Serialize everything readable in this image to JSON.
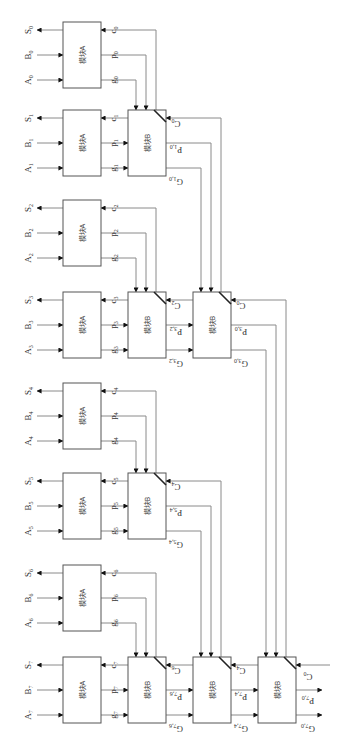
{
  "diagram": {
    "module_a_label": "模块A",
    "module_b_label": "模块B",
    "inputs": [
      {
        "a": "A",
        "b": "B",
        "s": "S",
        "i": "0",
        "c": "c",
        "p": "p",
        "g": "g"
      },
      {
        "a": "A",
        "b": "B",
        "s": "S",
        "i": "1",
        "c": "c",
        "p": "p",
        "g": "g"
      },
      {
        "a": "A",
        "b": "B",
        "s": "S",
        "i": "2",
        "c": "c",
        "p": "p",
        "g": "g"
      },
      {
        "a": "A",
        "b": "B",
        "s": "S",
        "i": "3",
        "c": "c",
        "p": "p",
        "g": "g"
      },
      {
        "a": "A",
        "b": "B",
        "s": "S",
        "i": "4",
        "c": "c",
        "p": "p",
        "g": "g"
      },
      {
        "a": "A",
        "b": "B",
        "s": "S",
        "i": "5",
        "c": "c",
        "p": "p",
        "g": "g"
      },
      {
        "a": "A",
        "b": "B",
        "s": "S",
        "i": "6",
        "c": "c",
        "p": "p",
        "g": "g"
      },
      {
        "a": "A",
        "b": "B",
        "s": "S",
        "i": "7",
        "c": "c",
        "p": "p",
        "g": "g"
      }
    ],
    "b_blocks": [
      {
        "id": "B10",
        "level": 1,
        "cin": "C",
        "cin_sub": "0",
        "p": "P",
        "p_sub": "1,0",
        "g": "G",
        "g_sub": "1,0"
      },
      {
        "id": "B32",
        "level": 1,
        "cin": "C",
        "cin_sub": "2",
        "p": "P",
        "p_sub": "3,2",
        "g": "G",
        "g_sub": "3,2"
      },
      {
        "id": "B54",
        "level": 1,
        "cin": "C",
        "cin_sub": "4",
        "p": "P",
        "p_sub": "5,4",
        "g": "G",
        "g_sub": "5,4"
      },
      {
        "id": "B76",
        "level": 1,
        "cin": "C",
        "cin_sub": "6",
        "p": "P",
        "p_sub": "7,6",
        "g": "G",
        "g_sub": "7,6"
      },
      {
        "id": "B30",
        "level": 2,
        "cin": "C",
        "cin_sub": "0",
        "p": "P",
        "p_sub": "3,0",
        "g": "G",
        "g_sub": "3,0"
      },
      {
        "id": "B74",
        "level": 2,
        "cin": "C",
        "cin_sub": "4",
        "p": "P",
        "p_sub": "7,4",
        "g": "G",
        "g_sub": "7,4"
      },
      {
        "id": "B70",
        "level": 3,
        "cin": "C",
        "cin_sub": "0",
        "p": "P",
        "p_sub": "7,0",
        "g": "G",
        "g_sub": "7,0"
      }
    ]
  }
}
